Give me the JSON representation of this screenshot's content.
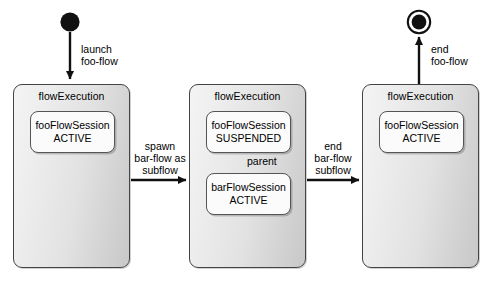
{
  "diagram": {
    "type": "state-diagram",
    "nodes": {
      "start": {
        "name": "start-node",
        "kind": "initial-state"
      },
      "end": {
        "name": "end-node",
        "kind": "final-state"
      }
    },
    "executions": [
      {
        "id": "exec-1",
        "title": "flowExecution",
        "sessions": [
          {
            "name": "fooFlowSession",
            "state": "ACTIVE"
          }
        ]
      },
      {
        "id": "exec-2",
        "title": "flowExecution",
        "sessions": [
          {
            "name": "fooFlowSession",
            "state": "SUSPENDED"
          },
          {
            "name": "barFlowSession",
            "state": "ACTIVE"
          }
        ],
        "internal_relation": "parent"
      },
      {
        "id": "exec-3",
        "title": "flowExecution",
        "sessions": [
          {
            "name": "fooFlowSession",
            "state": "ACTIVE"
          }
        ]
      }
    ],
    "transitions": [
      {
        "id": "t-launch",
        "lines": [
          "launch",
          "foo-flow"
        ],
        "direction": "down"
      },
      {
        "id": "t-spawn",
        "lines": [
          "spawn",
          "bar-flow as",
          "subflow"
        ],
        "direction": "right"
      },
      {
        "id": "t-end-sub",
        "lines": [
          "end",
          "bar-flow",
          "subflow"
        ],
        "direction": "right"
      },
      {
        "id": "t-end-flow",
        "lines": [
          "end",
          "foo-flow"
        ],
        "direction": "up"
      }
    ],
    "colors": {
      "stroke": "#444444",
      "ink": "#000000",
      "exec_fill_light": "#f4f4f4",
      "exec_fill_dark": "#c8c8c8",
      "session_fill": "#fbfbfb",
      "background": "#ffffff"
    }
  }
}
